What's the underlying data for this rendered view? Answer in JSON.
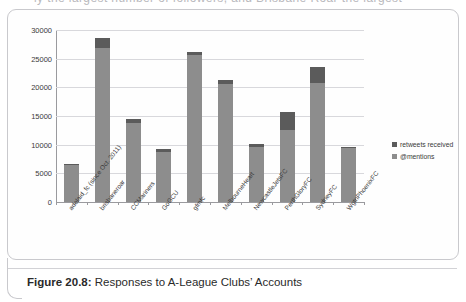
{
  "page": {
    "bleed_text": "ly the largest number of followers, and Brisbane Roar the largest"
  },
  "caption": {
    "label": "Figure 20.8:",
    "text": " Responses to A-League Clubs’ Accounts"
  },
  "legend": {
    "position": "right",
    "items": [
      {
        "label": "retweets received",
        "color": "#5b5b5b",
        "name": "retweets-received"
      },
      {
        "label": "@mentions",
        "color": "#8d8d8d",
        "name": "mentions"
      }
    ]
  },
  "chart_data": {
    "type": "bar",
    "subtype": "stacked",
    "title": "Responses to A-League Clubs’ Accounts",
    "xlabel": "",
    "ylabel": "",
    "ylim": [
      0,
      30000
    ],
    "yticks": [
      0,
      5000,
      10000,
      15000,
      20000,
      25000,
      30000
    ],
    "ytick_labels": [
      "0",
      "5000",
      "10000",
      "15000",
      "20000",
      "25000",
      "30000"
    ],
    "grid": true,
    "categories": [
      "adelaid_fc (since Oct. 2011)",
      "brisbaneroar",
      "CCMariners",
      "GoGCU",
      "gfmfc",
      "MelbourneHeart",
      "NewcastleJetsFC",
      "PerthGloryFC",
      "SydneyFC",
      "WgtnPhoenixFC"
    ],
    "series": [
      {
        "name": "@mentions",
        "color": "#8d8d8d",
        "values": [
          6400,
          26800,
          13800,
          8700,
          25600,
          20500,
          9600,
          12500,
          20700,
          9400
        ]
      },
      {
        "name": "retweets received",
        "color": "#5b5b5b",
        "values": [
          200,
          1800,
          600,
          500,
          600,
          700,
          550,
          3200,
          2800,
          200
        ]
      }
    ],
    "totals": [
      6600,
      28600,
      14400,
      9200,
      26200,
      21200,
      10150,
      15700,
      23500,
      9600
    ]
  }
}
